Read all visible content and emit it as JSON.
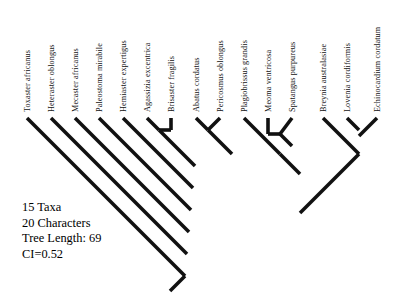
{
  "figure": {
    "kind": "cladogram",
    "title": "",
    "line_color": "#111111",
    "background_color": "#ffffff"
  },
  "taxa": [
    {
      "index": 0,
      "label": "Toxaster africanus",
      "tip_x": 27,
      "label_x": 24,
      "label_y": 112
    },
    {
      "index": 1,
      "label": "Heteraster oblongus",
      "tip_x": 51,
      "label_x": 48,
      "label_y": 112
    },
    {
      "index": 2,
      "label": "Mecaster africanus",
      "tip_x": 75,
      "label_x": 72,
      "label_y": 112
    },
    {
      "index": 3,
      "label": "Paleostoma mirabile",
      "tip_x": 99,
      "label_x": 96,
      "label_y": 112
    },
    {
      "index": 4,
      "label": "Hemiaster expertigus",
      "tip_x": 123,
      "label_x": 120,
      "label_y": 112
    },
    {
      "index": 5,
      "label": "Agassizia excentrica",
      "tip_x": 147,
      "label_x": 144,
      "label_y": 112
    },
    {
      "index": 6,
      "label": "Brisaster fragilis",
      "tip_x": 171,
      "label_x": 168,
      "label_y": 112
    },
    {
      "index": 7,
      "label": "Abatus cordatus",
      "tip_x": 196,
      "label_x": 193,
      "label_y": 112
    },
    {
      "index": 8,
      "label": "Pericosmus oblongus",
      "tip_x": 220,
      "label_x": 217,
      "label_y": 112
    },
    {
      "index": 9,
      "label": "Plagiobrissus grandis",
      "tip_x": 244,
      "label_x": 241,
      "label_y": 112
    },
    {
      "index": 10,
      "label": "Meoma ventricosa",
      "tip_x": 268,
      "label_x": 265,
      "label_y": 112
    },
    {
      "index": 11,
      "label": "Spatangus purpureus",
      "tip_x": 292,
      "label_x": 289,
      "label_y": 112
    },
    {
      "index": 12,
      "label": "Breynia australasiae",
      "tip_x": 323,
      "label_x": 320,
      "label_y": 112
    },
    {
      "index": 13,
      "label": "Lovenia cordiformis",
      "tip_x": 347,
      "label_x": 344,
      "label_y": 112
    },
    {
      "index": 14,
      "label": "Echinocardium cordatum",
      "tip_x": 377,
      "label_x": 374,
      "label_y": 112
    }
  ],
  "tree_geometry": {
    "tip_y": 118,
    "root_x": 185,
    "root_y": 276,
    "root_tail_x": 170,
    "root_tail_y": 291,
    "stroke_width": 3.6,
    "segments": [
      {
        "name": "tip-toxaster-africanus",
        "x1": 27,
        "y1": 118,
        "x2": 185,
        "y2": 276
      },
      {
        "name": "tip-heteraster-oblongus",
        "x1": 51,
        "y1": 118,
        "x2": 187,
        "y2": 254
      },
      {
        "name": "tip-mecaster-africanus",
        "x1": 75,
        "y1": 118,
        "x2": 189,
        "y2": 232
      },
      {
        "name": "tip-paleostoma-mirabile",
        "x1": 99,
        "y1": 118,
        "x2": 191,
        "y2": 210
      },
      {
        "name": "tip-hemiaster-expertigus",
        "x1": 123,
        "y1": 118,
        "x2": 193,
        "y2": 188
      },
      {
        "name": "tip-agassizia-excentrica",
        "x1": 147,
        "y1": 118,
        "x2": 159,
        "y2": 130
      },
      {
        "name": "tip-brisaster-fragilis",
        "x1": 171,
        "y1": 118,
        "x2": 171,
        "y2": 130
      },
      {
        "name": "bar-agassizia-brisaster",
        "x1": 159,
        "y1": 130,
        "x2": 171,
        "y2": 130
      },
      {
        "name": "clade-agassizia-brisaster-stem",
        "x1": 159,
        "y1": 130,
        "x2": 195,
        "y2": 166
      },
      {
        "name": "tip-abatus-cordatus",
        "x1": 196,
        "y1": 118,
        "x2": 208,
        "y2": 130
      },
      {
        "name": "tip-pericosmus-oblongus",
        "x1": 220,
        "y1": 118,
        "x2": 208,
        "y2": 130
      },
      {
        "name": "clade-abatus-pericosmus-stem",
        "x1": 208,
        "y1": 130,
        "x2": 232,
        "y2": 154
      },
      {
        "name": "tip-plagiobrissus-grandis",
        "x1": 244,
        "y1": 118,
        "x2": 280,
        "y2": 154
      },
      {
        "name": "tip-meoma-ventricosa",
        "x1": 268,
        "y1": 118,
        "x2": 268,
        "y2": 134
      },
      {
        "name": "tip-spatangus-purpureus",
        "x1": 292,
        "y1": 118,
        "x2": 280,
        "y2": 134
      },
      {
        "name": "bar-meoma-spatangus",
        "x1": 268,
        "y1": 134,
        "x2": 280,
        "y2": 134
      },
      {
        "name": "clade-meoma-spatangus-stem",
        "x1": 280,
        "y1": 134,
        "x2": 292,
        "y2": 146
      },
      {
        "name": "clade-plagiobrissus-group-stem",
        "x1": 280,
        "y1": 154,
        "x2": 300,
        "y2": 174
      },
      {
        "name": "tip-breynia-australasiae",
        "x1": 323,
        "y1": 118,
        "x2": 359,
        "y2": 154
      },
      {
        "name": "tip-lovenia-cordiformis",
        "x1": 347,
        "y1": 118,
        "x2": 359,
        "y2": 130
      },
      {
        "name": "tip-echinocardium-cordatum",
        "x1": 377,
        "y1": 118,
        "x2": 359,
        "y2": 136
      },
      {
        "name": "clade-breynia-group-stem",
        "x1": 359,
        "y1": 154,
        "x2": 300,
        "y2": 213
      },
      {
        "name": "root-tail",
        "x1": 185,
        "y1": 276,
        "x2": 170,
        "y2": 291
      }
    ]
  },
  "stats": {
    "taxa_line": "15 Taxa",
    "characters_line": "20 Characters",
    "tree_length_line": "Tree Length: 69",
    "ci_line": "CI=0.52",
    "taxa_count": 15,
    "characters": 20,
    "tree_length": 69,
    "ci": 0.52
  }
}
